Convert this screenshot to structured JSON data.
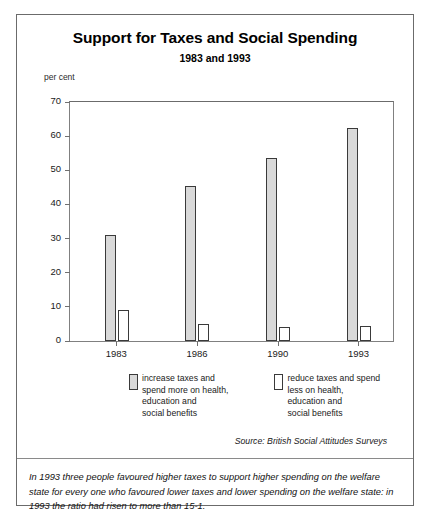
{
  "figure": {
    "title": "Support for Taxes and Social Spending",
    "subtitle": "1983 and 1993",
    "axis_unit_label": "per cent",
    "source_note": "Source: British Social Attitudes Surveys",
    "footnote": "In 1993 three people favoured higher taxes to support higher spending on the welfare state for every one who favoured lower taxes and lower spending on the welfare state: in 1993 the ratio had risen to more than 15-1."
  },
  "legend": {
    "entries": [
      {
        "swatch": "filled",
        "swatch_color": "#d9d9d9",
        "label": "increase taxes and\nspend more on health,\neducation and\nsocial benefits"
      },
      {
        "swatch": "hollow",
        "swatch_color": "#ffffff",
        "label": "reduce taxes and spend\nless on health,\neducation and\nsocial benefits"
      }
    ]
  },
  "chart_data": {
    "type": "bar",
    "title": "Support for Taxes and Social Spending",
    "subtitle": "1983 and 1993",
    "xlabel": "",
    "ylabel": "per cent",
    "ylim": [
      0,
      70
    ],
    "yticks": [
      0,
      10,
      20,
      30,
      40,
      50,
      60,
      70
    ],
    "ytick_labels": [
      "0",
      "10",
      "20",
      "30",
      "40",
      "50",
      "60",
      "70"
    ],
    "grid": false,
    "legend_position": "below",
    "categories": [
      "1983",
      "1986",
      "1990",
      "1993"
    ],
    "series": [
      {
        "name": "increase taxes and spend more on health, education and social benefits",
        "color": "#d9d9d9",
        "values": [
          31,
          45.5,
          53.5,
          62.5
        ]
      },
      {
        "name": "reduce taxes and spend less on health, education and social benefits",
        "color": "#ffffff",
        "values": [
          9,
          5,
          4,
          4.5
        ]
      }
    ],
    "source": "British Social Attitudes Surveys"
  }
}
